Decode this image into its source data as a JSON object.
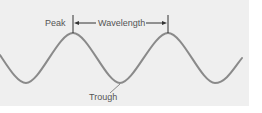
{
  "diagram": {
    "title": "",
    "labels": {
      "peak": "Peak",
      "wavelength": "Wavelength",
      "trough": "Trough"
    },
    "colors": {
      "background": "#efefef",
      "wave": "#8a8a8a",
      "text": "#555555",
      "marker": "#333333"
    }
  }
}
